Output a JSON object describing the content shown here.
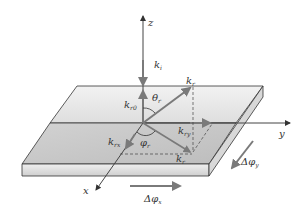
{
  "diagram": {
    "type": "3d-coordinate-wave-vector-diagram",
    "axes": {
      "z": "z",
      "y": "y",
      "x": "x"
    },
    "vectors": {
      "incident": {
        "base": "k",
        "sub": "i"
      },
      "reflected": {
        "base": "k",
        "sub": "r"
      },
      "reflected_z": {
        "base": "k",
        "sub": "r0"
      },
      "reflected_xy": {
        "base": "k",
        "sub": "ry"
      },
      "reflected_x": {
        "base": "k",
        "sub": "rx"
      },
      "k_parallel": {
        "base": "k",
        "sub": "r"
      }
    },
    "angles": {
      "theta": {
        "base": "θ",
        "sub": "r"
      },
      "phi": {
        "base": "φ",
        "sub": "r"
      }
    },
    "phase_gradients": {
      "x": {
        "prefix": "Δφ",
        "sub": "x"
      },
      "y": {
        "prefix": "Δφ",
        "sub": "y"
      }
    },
    "colors": {
      "plate_top_back": "#e6e6e6",
      "plate_top_front": "#c8c8c8",
      "plate_edge": "#dcdcdc",
      "arrow_gray": "#7a7a7a",
      "line_dark": "#333333"
    }
  }
}
